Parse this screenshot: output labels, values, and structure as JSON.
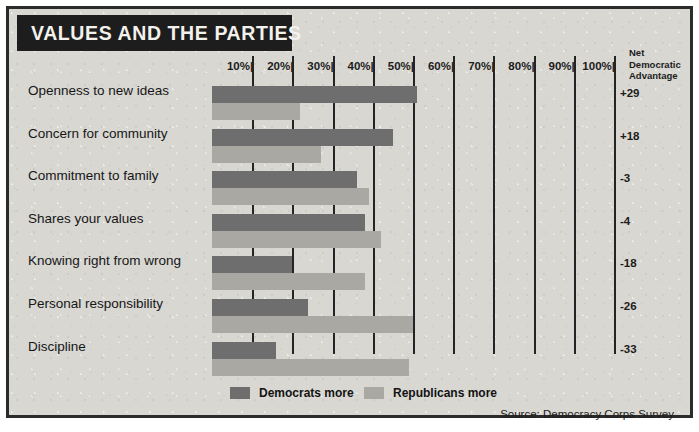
{
  "title": "VALUES AND THE PARTIES",
  "net_header": "Net Democratic Advantage",
  "net_header_lines": [
    "Net",
    "Democratic",
    "Advantage"
  ],
  "legend": [
    {
      "label": "Democrats more",
      "color": "#6e6e6e"
    },
    {
      "label": "Republicans more",
      "color": "#a9a8a3"
    }
  ],
  "source": "Source: Democracy Corps Survey",
  "colors": {
    "democrat": "#6e6e6e",
    "republican": "#a9a8a3",
    "paper": "#d8d7d2",
    "ink": "#1d1d1d"
  },
  "chart_data": {
    "type": "bar",
    "title": "VALUES AND THE PARTIES",
    "xlabel": "",
    "ylabel": "",
    "xlim": [
      0,
      100
    ],
    "xticks": [
      10,
      20,
      30,
      40,
      50,
      60,
      70,
      80,
      90,
      100
    ],
    "xtick_labels": [
      "10%",
      "20%",
      "30%",
      "40%",
      "50%",
      "60%",
      "70%",
      "80%",
      "90%",
      "100%"
    ],
    "grid": true,
    "orientation": "horizontal",
    "legend_position": "bottom-left",
    "categories": [
      "Openness to new ideas",
      "Concern for community",
      "Commitment to family",
      "Shares your values",
      "Knowing right from wrong",
      "Personal responsibility",
      "Discipline"
    ],
    "series": [
      {
        "name": "Democrats more",
        "color": "#6e6e6e",
        "values": [
          51,
          45,
          36,
          38,
          20,
          24,
          16
        ]
      },
      {
        "name": "Republicans more",
        "color": "#a9a8a3",
        "values": [
          22,
          27,
          39,
          42,
          38,
          50,
          49
        ]
      }
    ],
    "annotations": {
      "column_label": "Net Democratic Advantage",
      "values": [
        "+29",
        "+18",
        "-3",
        "-4",
        "-18",
        "-26",
        "-33"
      ]
    }
  }
}
